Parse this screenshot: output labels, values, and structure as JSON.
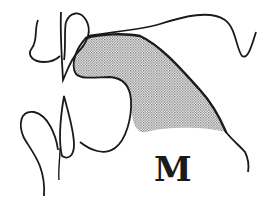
{
  "figure": {
    "label": "M",
    "colors": {
      "line": "#1a1a1a",
      "shading": "#9a9a9a",
      "background": "#ffffff"
    }
  }
}
